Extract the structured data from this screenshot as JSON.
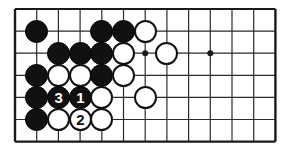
{
  "board": {
    "name": "go-board-diagram",
    "background_color": "#ffffff",
    "line_color": "#2b2b2b",
    "edge_line_color": "#1a1a1a",
    "black_color": "#111111",
    "white_color": "#ffffff",
    "origin_x": 15,
    "origin_y": 9,
    "spacing_x": 21.7,
    "spacing_y": 22.1,
    "cols": 12,
    "rows": 7,
    "left_is_edge": true,
    "top_is_edge": true,
    "right_is_edge": true,
    "bottom_is_edge": false,
    "star_points": [
      {
        "col": 6,
        "row": 2,
        "label": "star-point-left"
      },
      {
        "col": 9,
        "row": 2,
        "label": "star-point-right"
      }
    ]
  },
  "stones": [
    {
      "name": "black-stone-b1",
      "color": "black",
      "col": 1,
      "row": 1,
      "label": ""
    },
    {
      "name": "black-stone-b2",
      "color": "black",
      "col": 4,
      "row": 1,
      "label": ""
    },
    {
      "name": "black-stone-b3",
      "color": "black",
      "col": 5,
      "row": 1,
      "label": ""
    },
    {
      "name": "white-stone-w1",
      "color": "white",
      "col": 6,
      "row": 1,
      "label": ""
    },
    {
      "name": "black-stone-b4",
      "color": "black",
      "col": 2,
      "row": 2,
      "label": ""
    },
    {
      "name": "black-stone-b5",
      "color": "black",
      "col": 3,
      "row": 2,
      "label": ""
    },
    {
      "name": "black-stone-b6",
      "color": "black",
      "col": 4,
      "row": 2,
      "label": ""
    },
    {
      "name": "white-stone-w2",
      "color": "white",
      "col": 5,
      "row": 2,
      "label": ""
    },
    {
      "name": "white-stone-w3",
      "color": "white",
      "col": 7,
      "row": 2,
      "label": ""
    },
    {
      "name": "black-stone-b7",
      "color": "black",
      "col": 1,
      "row": 3,
      "label": ""
    },
    {
      "name": "white-stone-w4",
      "color": "white",
      "col": 2,
      "row": 3,
      "label": ""
    },
    {
      "name": "white-stone-w5",
      "color": "white",
      "col": 3,
      "row": 3,
      "label": ""
    },
    {
      "name": "black-stone-b8",
      "color": "black",
      "col": 4,
      "row": 3,
      "label": ""
    },
    {
      "name": "white-stone-w6",
      "color": "white",
      "col": 5,
      "row": 3,
      "label": ""
    },
    {
      "name": "black-stone-b9",
      "color": "black",
      "col": 1,
      "row": 4,
      "label": ""
    },
    {
      "name": "black-stone-move-3",
      "color": "black",
      "col": 2,
      "row": 4,
      "label": "3"
    },
    {
      "name": "black-stone-move-1",
      "color": "black",
      "col": 3,
      "row": 4,
      "label": "1"
    },
    {
      "name": "white-stone-w7",
      "color": "white",
      "col": 4,
      "row": 4,
      "label": ""
    },
    {
      "name": "white-stone-w8",
      "color": "white",
      "col": 6,
      "row": 4,
      "label": ""
    },
    {
      "name": "black-stone-b10",
      "color": "black",
      "col": 1,
      "row": 5,
      "label": ""
    },
    {
      "name": "white-stone-w9",
      "color": "white",
      "col": 2,
      "row": 5,
      "label": ""
    },
    {
      "name": "white-stone-move-2",
      "color": "white",
      "col": 3,
      "row": 5,
      "label": "2"
    },
    {
      "name": "white-stone-w10",
      "color": "white",
      "col": 4,
      "row": 5,
      "label": ""
    }
  ]
}
